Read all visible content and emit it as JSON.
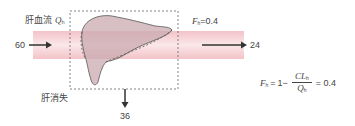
{
  "diagram": {
    "labels": {
      "hepatic_blood_flow": "肝血流",
      "flow_symbol": "Q",
      "flow_subscript": "h",
      "hepatic_elimination": "肝消失"
    },
    "flows": {
      "inflow": "60",
      "outflow": "24",
      "eliminated": "36"
    },
    "extraction": {
      "symbol": "F",
      "subscript": "h",
      "equals_value": "=0.4"
    },
    "formula": {
      "lhs_symbol": "F",
      "lhs_subscript": "h",
      "equals": "=",
      "one_minus": "1−",
      "numerator": "CL",
      "numerator_subscript": "h",
      "denominator": "Q",
      "denominator_subscript": "h",
      "result": "= 0.4"
    },
    "colors": {
      "vessel_fill": "#f6d3d6",
      "vessel_edge": "#e8a5ac",
      "liver_fill": "#c9aab0",
      "arrow": "#333333",
      "dashed_box": "#777777"
    }
  }
}
